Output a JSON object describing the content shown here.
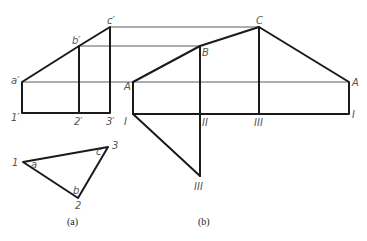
{
  "figure_a": {
    "caption": "(a)",
    "front_view_labels": {
      "a_prime": "a′",
      "b_prime": "b′",
      "c_prime": "c′",
      "p1_prime": "1′",
      "p2_prime": "2′",
      "p3_prime": "3′"
    },
    "triangle_labels": {
      "p1": "1",
      "p2": "2",
      "p3": "3",
      "angle_a": "a",
      "angle_b": "b",
      "angle_c": "c"
    }
  },
  "figure_b": {
    "caption": "(b)",
    "labels": {
      "A_left": "A",
      "B": "B",
      "C": "C",
      "A_right": "A",
      "I_left": "I",
      "II": "II",
      "III_top": "III",
      "I_right": "I",
      "III_bottom": "III"
    }
  }
}
